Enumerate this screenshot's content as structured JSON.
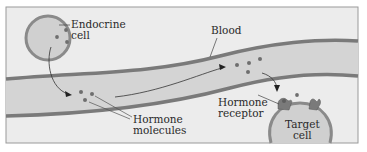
{
  "labels": {
    "endocrine_cell": [
      "Endocrine",
      "cell"
    ],
    "blood": "Blood",
    "hormone_molecules": [
      "Hormone",
      "molecules"
    ],
    "hormone_receptor": [
      "Hormone",
      "receptor"
    ],
    "target_cell": [
      "Target",
      "cell"
    ]
  },
  "colors": {
    "frame_fill": "#ececec",
    "frame_stroke": "#9a9a9a",
    "vessel_wall": "#7a7a7a",
    "vessel_lumen": "#d4d4d4",
    "cell_membrane": "#8a8a8a",
    "cell_fill": "#d0d0d0",
    "hormone_dot": "#6e6e6e",
    "text": "#2a2a2a"
  }
}
